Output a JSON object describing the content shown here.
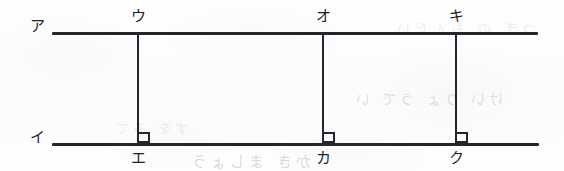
{
  "figure": {
    "background_color": "#fdfdfd",
    "stroke_color": "#24262b",
    "label_color": "#1d1f23",
    "lines": {
      "top": {
        "label": "ア",
        "x1": 52,
        "x2": 538,
        "y": 32
      },
      "bottom": {
        "label": "イ",
        "x1": 52,
        "x2": 539,
        "y": 143
      }
    },
    "verticals": [
      {
        "x": 137,
        "top_label": "ウ",
        "bottom_label": "エ",
        "right_angle": true
      },
      {
        "x": 322,
        "top_label": "オ",
        "bottom_label": "カ",
        "right_angle": true
      },
      {
        "x": 455,
        "top_label": "キ",
        "bottom_label": "ク",
        "right_angle": true
      }
    ],
    "labels": {
      "top_line": "ア",
      "bottom_line": "イ",
      "top_vertex_1": "ウ",
      "top_vertex_2": "オ",
      "top_vertex_3": "キ",
      "bottom_vertex_1": "エ",
      "bottom_vertex_2": "カ",
      "bottom_vertex_3": "ク"
    },
    "bleed_through": {
      "row_1": "けい りょ うで い",
      "row_2": "かき ましょう",
      "row_3": "つぎ の もんだい",
      "row_4": "ずを みて"
    }
  }
}
